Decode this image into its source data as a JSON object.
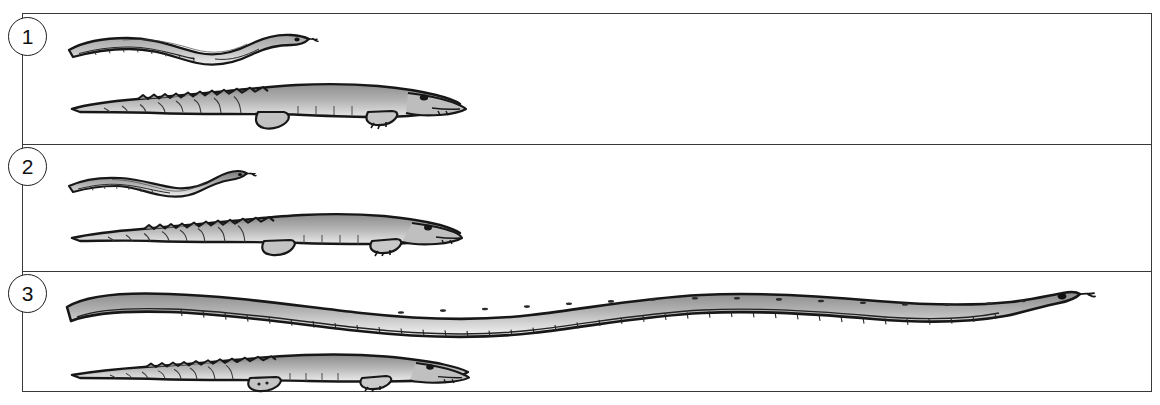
{
  "figure": {
    "kind": "comparative-size-illustration",
    "background_color": "#ffffff",
    "ink_color": "#1d1d1d",
    "frame_border_color": "#3a3a3a",
    "fill_light": "#d9d9d9",
    "fill_mid": "#a8a8a8",
    "fill_dark": "#8a8a8a",
    "frame": {
      "x": 22,
      "y": 13,
      "width": 1130,
      "height": 379
    }
  },
  "panels": [
    {
      "number": "1",
      "badge_name": "panel-number-1",
      "top": 0,
      "height": 130,
      "animals": [
        {
          "species": "snake",
          "name": "snake-panel-1",
          "x": 42,
          "y": 14,
          "width": 248,
          "height": 30,
          "orientation": "head-right",
          "relative_length": "short"
        },
        {
          "species": "crocodile",
          "name": "crocodile-panel-1",
          "x": 45,
          "y": 62,
          "width": 396,
          "height": 52,
          "orientation": "head-right",
          "relative_length": "long"
        }
      ]
    },
    {
      "number": "2",
      "badge_name": "panel-number-2",
      "top": 130,
      "height": 127,
      "animals": [
        {
          "species": "snake",
          "name": "snake-panel-2",
          "x": 43,
          "y": 22,
          "width": 185,
          "height": 26,
          "orientation": "head-right",
          "relative_length": "very-short"
        },
        {
          "species": "crocodile",
          "name": "crocodile-panel-2",
          "x": 45,
          "y": 58,
          "width": 390,
          "height": 50,
          "orientation": "head-right",
          "relative_length": "long"
        }
      ]
    },
    {
      "number": "3",
      "badge_name": "panel-number-3",
      "top": 257,
      "height": 122,
      "animals": [
        {
          "species": "snake",
          "name": "snake-panel-3",
          "x": 38,
          "y": 10,
          "width": 1025,
          "height": 52,
          "orientation": "head-right",
          "relative_length": "very-long"
        },
        {
          "species": "crocodile",
          "name": "crocodile-panel-3",
          "x": 45,
          "y": 74,
          "width": 400,
          "height": 44,
          "orientation": "head-right",
          "relative_length": "long"
        }
      ]
    }
  ]
}
